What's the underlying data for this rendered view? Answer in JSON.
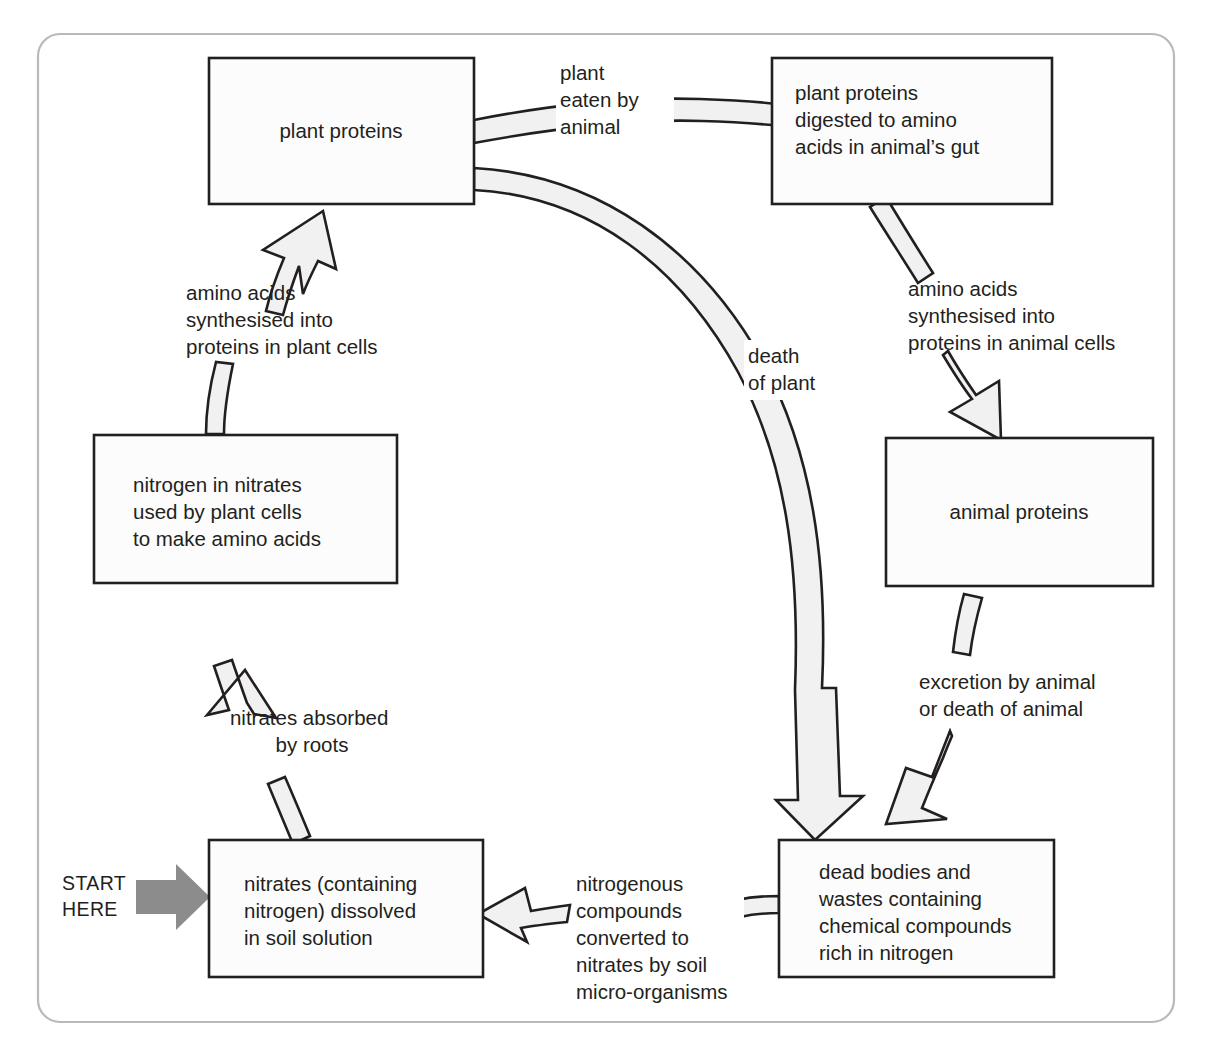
{
  "diagram": {
    "type": "cycle-flow-diagram",
    "frame": {
      "style": "rounded-rectangle",
      "stroke_color": "#b9b9b9"
    },
    "colors": {
      "box_fill": "#fcfcfc",
      "box_stroke": "#231f20",
      "arrow_fill": "#f1f1f1",
      "arrow_stroke": "#231f20",
      "start_arrow_fill": "#8c8c8c",
      "text": "#231f20"
    },
    "start_marker": {
      "label_line1": "START",
      "label_line2": "HERE",
      "icon": "right-block-arrow-icon"
    },
    "boxes": [
      {
        "id": "plant-proteins",
        "lines": [
          "plant proteins"
        ]
      },
      {
        "id": "plant-proteins-digested",
        "lines": [
          "plant proteins",
          "digested to amino",
          "acids in animal’s gut"
        ]
      },
      {
        "id": "nitrogen-in-nitrates",
        "lines": [
          "nitrogen in nitrates",
          "used by plant cells",
          "to make amino acids"
        ]
      },
      {
        "id": "animal-proteins",
        "lines": [
          "animal proteins"
        ]
      },
      {
        "id": "nitrates-in-soil",
        "lines": [
          "nitrates (containing",
          "nitrogen) dissolved",
          "in soil solution"
        ]
      },
      {
        "id": "dead-bodies-and-wastes",
        "lines": [
          "dead bodies and",
          "wastes containing",
          "chemical compounds",
          "rich in nitrogen"
        ]
      }
    ],
    "arrow_labels": [
      {
        "id": "plant-eaten-by-animal",
        "lines": [
          "plant",
          "eaten by",
          "animal"
        ],
        "from": "plant-proteins",
        "to": "plant-proteins-digested"
      },
      {
        "id": "amino-acids-plant-cells",
        "lines": [
          "amino acids",
          "synthesised into",
          "proteins in plant cells"
        ],
        "from": "nitrogen-in-nitrates",
        "to": "plant-proteins"
      },
      {
        "id": "death-of-plant",
        "lines": [
          "death",
          "of plant"
        ],
        "from": "plant-proteins",
        "to": "dead-bodies-and-wastes"
      },
      {
        "id": "amino-acids-animal-cells",
        "lines": [
          "amino acids",
          "synthesised into",
          "proteins in animal cells"
        ],
        "from": "plant-proteins-digested",
        "to": "animal-proteins"
      },
      {
        "id": "excretion-or-death-of-animal",
        "lines": [
          "excretion by animal",
          "or death of animal"
        ],
        "from": "animal-proteins",
        "to": "dead-bodies-and-wastes"
      },
      {
        "id": "nitrates-absorbed-by-roots",
        "lines": [
          "nitrates absorbed",
          "by roots"
        ],
        "from": "nitrates-in-soil",
        "to": "nitrogen-in-nitrates"
      },
      {
        "id": "nitrogenous-compounds-converted",
        "lines": [
          "nitrogenous",
          "compounds",
          "converted to",
          "nitrates by soil",
          "micro-organisms"
        ],
        "from": "dead-bodies-and-wastes",
        "to": "nitrates-in-soil"
      }
    ]
  }
}
